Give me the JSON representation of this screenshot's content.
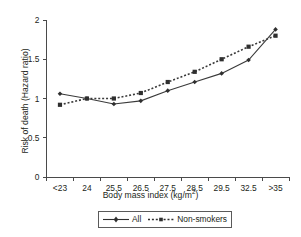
{
  "chart_data": {
    "type": "line",
    "title": "",
    "xlabel": "Body mass index (kg/m2)",
    "xlabel_base": "Body mass index (kg/m",
    "xlabel_sup": "2",
    "xlabel_tail": ")",
    "ylabel": "Risk of death (Hazard ratio)",
    "categories": [
      "<23",
      "24",
      "25.5",
      "26.5",
      "27.5",
      "28.5",
      "29.5",
      "32.5",
      ">35"
    ],
    "xtick_labels": [
      "<23",
      "24",
      "25.5",
      "26.5",
      "27.5",
      "28.5",
      "29.5",
      "32.5",
      ">35"
    ],
    "ytick_labels": [
      "0",
      "0.5",
      "1",
      "1.5",
      "2"
    ],
    "ytick_values": [
      0,
      0.5,
      1,
      1.5,
      2
    ],
    "ylim": [
      0,
      2
    ],
    "grid": false,
    "legend_position": "below-axis-centered",
    "series": [
      {
        "name": "All",
        "style": "solid",
        "marker": "diamond",
        "color": "#2f2f2f",
        "values": [
          1.06,
          1.0,
          0.93,
          0.97,
          1.1,
          1.21,
          1.32,
          1.49,
          1.88
        ]
      },
      {
        "name": "Non-smokers",
        "style": "dotted",
        "marker": "square",
        "color": "#2f2f2f",
        "values": [
          0.92,
          1.0,
          1.0,
          1.07,
          1.21,
          1.34,
          1.5,
          1.66,
          1.8
        ]
      }
    ],
    "legend": [
      {
        "label": "All",
        "style": "solid",
        "marker": "diamond"
      },
      {
        "label": "Non-smokers",
        "style": "dotted",
        "marker": "square"
      }
    ]
  }
}
